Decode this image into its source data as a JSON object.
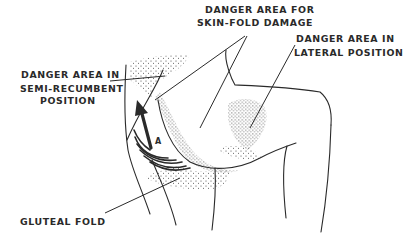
{
  "diagram": {
    "labels": {
      "skin_fold_line1": "DANGER AREA FOR",
      "skin_fold_line2": "SKIN-FOLD DAMAGE",
      "lateral_line1": "DANGER AREA IN",
      "lateral_line2": "LATERAL POSITION",
      "semi_line1": "DANGER AREA IN",
      "semi_line2": "SEMI-RECUMBENT",
      "semi_line3": "POSITION",
      "gluteal": "GLUTEAL FOLD",
      "arrow_marker": "A"
    },
    "colors": {
      "ink": "#2a2a2a",
      "background": "#ffffff"
    }
  }
}
